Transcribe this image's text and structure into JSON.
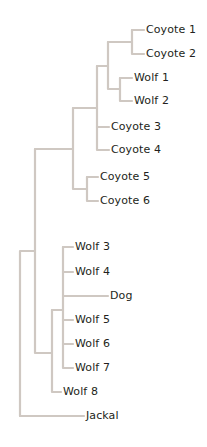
{
  "diagram": {
    "type": "phylogenetic-tree",
    "line_color": "#cfc8c2",
    "text_color": "#231f20",
    "leaves": [
      {
        "id": "coyote1",
        "label": "Coyote 1",
        "x": 146,
        "y": 30
      },
      {
        "id": "coyote2",
        "label": "Coyote 2",
        "x": 146,
        "y": 54
      },
      {
        "id": "wolf1",
        "label": "Wolf 1",
        "x": 134,
        "y": 78
      },
      {
        "id": "wolf2",
        "label": "Wolf 2",
        "x": 134,
        "y": 101
      },
      {
        "id": "coyote3",
        "label": "Coyote 3",
        "x": 111,
        "y": 127
      },
      {
        "id": "coyote4",
        "label": "Coyote 4",
        "x": 111,
        "y": 150
      },
      {
        "id": "coyote5",
        "label": "Coyote 5",
        "x": 100,
        "y": 177
      },
      {
        "id": "coyote6",
        "label": "Coyote 6",
        "x": 100,
        "y": 201
      },
      {
        "id": "wolf3",
        "label": "Wolf 3",
        "x": 75,
        "y": 247
      },
      {
        "id": "wolf4",
        "label": "Wolf 4",
        "x": 75,
        "y": 272
      },
      {
        "id": "dog",
        "label": "Dog",
        "x": 110,
        "y": 296
      },
      {
        "id": "wolf5",
        "label": "Wolf 5",
        "x": 75,
        "y": 320
      },
      {
        "id": "wolf6",
        "label": "Wolf 6",
        "x": 75,
        "y": 344
      },
      {
        "id": "wolf7",
        "label": "Wolf 7",
        "x": 75,
        "y": 368
      },
      {
        "id": "wolf8",
        "label": "Wolf 8",
        "x": 63,
        "y": 392
      },
      {
        "id": "jackal",
        "label": "Jackal",
        "x": 86,
        "y": 416
      }
    ],
    "branches": [
      "M20 416 L20 251 L35 251",
      "M20 416 L84 416",
      "M35 149 L35 353 L52 353",
      "M35 149 L73 149",
      "M73 108 L73 189 L87 189",
      "M73 108 L97 108",
      "M97 66 L97 150 L109 150",
      "M97 127 L109 127",
      "M97 66 L108 66",
      "M108 42 L108 89 L120 89",
      "M108 42 L132 42",
      "M132 30 L132 54 L144 54",
      "M132 30 L144 30",
      "M120 78 L120 101 L132 101",
      "M120 78 L132 78",
      "M87 177 L87 201 L98 201",
      "M87 177 L98 177",
      "M52 310 L52 392 L61 392",
      "M52 310 L63 310",
      "M63 247 L63 368 L73 368",
      "M63 247 L73 247",
      "M63 272 L73 272",
      "M63 296 L108 296",
      "M63 320 L73 320",
      "M63 344 L73 344"
    ]
  }
}
